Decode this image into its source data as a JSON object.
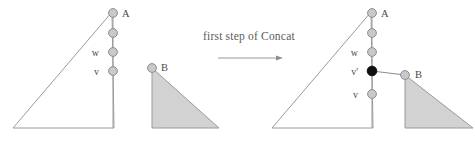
{
  "figure": {
    "title_caption": "first  step of Concat",
    "background_color": "#ffffff",
    "stroke_color": "#9a9a9a",
    "triangle_fill_gray": "#d2d2d2",
    "node_fill_open": "#c9c9c9",
    "node_fill_solid": "#101010",
    "node_stroke": "#8c8c8c",
    "label_color": "#4a4a4a"
  },
  "arrow": {
    "name": "transition-arrow",
    "x1": 218,
    "y1": 58,
    "x2": 283,
    "y2": 58
  },
  "left_panel": {
    "name": "before-state",
    "triangle_a": {
      "label": "A",
      "filled": false,
      "points": "13,128 114,128 112,12"
    },
    "triangle_b": {
      "label": "B",
      "filled": true,
      "points": "152,68 152,128 219,128"
    },
    "chain": {
      "x": 113,
      "nodes": [
        {
          "id": "a",
          "label": "A",
          "label_side": "right",
          "y": 13,
          "solid": false
        },
        {
          "id": "mid",
          "label": "",
          "label_side": "none",
          "y": 33,
          "solid": false
        },
        {
          "id": "w",
          "label": "w",
          "label_side": "left",
          "y": 52,
          "solid": false
        },
        {
          "id": "v",
          "label": "v",
          "label_side": "left",
          "y": 71,
          "solid": false
        }
      ],
      "tail_y": 128
    },
    "b_node": {
      "label": "B",
      "x": 152,
      "y": 68,
      "solid": false
    }
  },
  "right_panel": {
    "name": "after-state",
    "triangle_a": {
      "label": "A",
      "filled": false,
      "points": "272,128 373,128 371,12"
    },
    "triangle_b": {
      "label": "B",
      "filled": true,
      "points": "405,75 405,128 473,128"
    },
    "chain": {
      "x": 372,
      "nodes": [
        {
          "id": "a",
          "label": "A",
          "label_side": "right",
          "y": 13,
          "solid": false
        },
        {
          "id": "mid",
          "label": "",
          "label_side": "none",
          "y": 33,
          "solid": false
        },
        {
          "id": "w",
          "label": "w",
          "label_side": "left",
          "y": 52,
          "solid": false
        },
        {
          "id": "vprime",
          "label": "v'",
          "label_side": "left",
          "y": 71,
          "solid": true
        },
        {
          "id": "v",
          "label": "v",
          "label_side": "left",
          "y": 94,
          "solid": false
        }
      ],
      "tail_y": 128
    },
    "b_node": {
      "label": "B",
      "x": 405,
      "y": 75,
      "solid": false
    },
    "concat_link": {
      "from_x": 372,
      "from_y": 71,
      "to_x": 405,
      "to_y": 75
    }
  }
}
